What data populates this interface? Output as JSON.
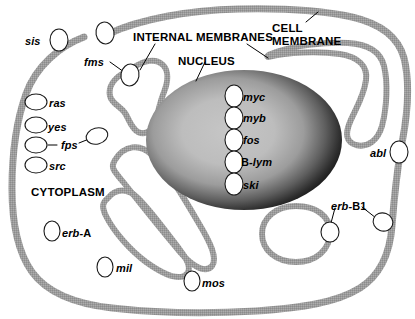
{
  "diagram": {
    "colors": {
      "membrane": "#9a9a9a",
      "membrane_dark": "#8a8a8a",
      "nucleus_rim": "#1c1c1c",
      "nucleus_center": "#c2c2c2",
      "background": "#ffffff",
      "ink": "#000000",
      "protein_fill": "#ffffff",
      "protein_stroke": "#1a1a1a"
    },
    "region_labels": [
      {
        "id": "internal-membranes",
        "text": "INTERNAL MEMBRANES",
        "x": 133,
        "y": 32
      },
      {
        "id": "cell-membrane",
        "text": "CELL\nMEMBRANE",
        "x": 272,
        "y": 22
      },
      {
        "id": "nucleus",
        "text": "NUCLEUS",
        "x": 178,
        "y": 56
      },
      {
        "id": "cytoplasm",
        "text": "CYTOPLASM",
        "x": 31,
        "y": 187
      }
    ],
    "gene_labels": [
      {
        "id": "sis",
        "text": "sis",
        "suffix": "",
        "x": 25,
        "y": 36
      },
      {
        "id": "fms",
        "text": "fms",
        "suffix": "",
        "x": 84,
        "y": 57
      },
      {
        "id": "ras",
        "text": "ras",
        "suffix": "",
        "x": 49,
        "y": 98
      },
      {
        "id": "yes",
        "text": "yes",
        "suffix": "",
        "x": 48,
        "y": 122
      },
      {
        "id": "fps",
        "text": "fps",
        "suffix": "",
        "x": 61,
        "y": 140
      },
      {
        "id": "src",
        "text": "src",
        "suffix": "",
        "x": 49,
        "y": 161
      },
      {
        "id": "erb-A",
        "text": "erb-",
        "suffix": "A",
        "x": 62,
        "y": 228
      },
      {
        "id": "mil",
        "text": "mil",
        "suffix": "",
        "x": 116,
        "y": 263
      },
      {
        "id": "mos",
        "text": "mos",
        "suffix": "",
        "x": 202,
        "y": 278
      },
      {
        "id": "abl",
        "text": "abl",
        "suffix": "",
        "x": 370,
        "y": 148
      },
      {
        "id": "erb-B1",
        "text": "erb-",
        "suffix": "B1",
        "x": 331,
        "y": 201
      }
    ],
    "nucleus_genes": [
      {
        "id": "myc",
        "text": "myc",
        "suffix": "",
        "x": 243,
        "y": 92
      },
      {
        "id": "myb",
        "text": "myb",
        "suffix": "",
        "x": 243,
        "y": 113
      },
      {
        "id": "fos",
        "text": "fos",
        "suffix": "",
        "x": 243,
        "y": 135
      },
      {
        "id": "B-lym",
        "text": "B-",
        "suffix": "",
        "upfirst": "B-",
        "rest": "lym",
        "x": 241,
        "y": 157
      },
      {
        "id": "ski",
        "text": "ski",
        "suffix": "",
        "x": 243,
        "y": 180
      }
    ],
    "proteins": [
      {
        "id": "protein-sis",
        "cx": 59,
        "cy": 40,
        "rx": 9,
        "ry": 11,
        "rot": 0,
        "location": "extracellular"
      },
      {
        "id": "protein-fms-top",
        "cx": 105,
        "cy": 33,
        "rx": 9,
        "ry": 11,
        "rot": -10,
        "location": "cell-membrane"
      },
      {
        "id": "protein-fms",
        "cx": 130,
        "cy": 75,
        "rx": 9,
        "ry": 11,
        "rot": 10,
        "location": "internal-membrane"
      },
      {
        "id": "protein-ras",
        "cx": 36,
        "cy": 102,
        "rx": 11,
        "ry": 8,
        "rot": 0,
        "location": "cell-membrane"
      },
      {
        "id": "protein-yes",
        "cx": 36,
        "cy": 125,
        "rx": 11,
        "ry": 8,
        "rot": 0,
        "location": "cell-membrane"
      },
      {
        "id": "protein-fps",
        "cx": 36,
        "cy": 145,
        "rx": 11,
        "ry": 8,
        "rot": 0,
        "location": "cell-membrane"
      },
      {
        "id": "protein-fps-free",
        "cx": 97,
        "cy": 136,
        "rx": 11,
        "ry": 8,
        "rot": -15,
        "location": "cytoplasm"
      },
      {
        "id": "protein-src",
        "cx": 36,
        "cy": 165,
        "rx": 11,
        "ry": 8,
        "rot": 0,
        "location": "cell-membrane"
      },
      {
        "id": "protein-erb-A",
        "cx": 52,
        "cy": 231,
        "rx": 8,
        "ry": 10,
        "rot": 0,
        "location": "cytoplasm"
      },
      {
        "id": "protein-mil",
        "cx": 105,
        "cy": 267,
        "rx": 8,
        "ry": 10,
        "rot": 0,
        "location": "cytoplasm"
      },
      {
        "id": "protein-mos",
        "cx": 192,
        "cy": 281,
        "rx": 8,
        "ry": 10,
        "rot": 0,
        "location": "cytoplasm"
      },
      {
        "id": "protein-abl",
        "cx": 399,
        "cy": 152,
        "rx": 9,
        "ry": 11,
        "rot": 0,
        "location": "cell-membrane"
      },
      {
        "id": "protein-erb-B1-membrane",
        "cx": 383,
        "cy": 222,
        "rx": 10,
        "ry": 9,
        "rot": 20,
        "location": "cell-membrane"
      },
      {
        "id": "protein-erb-B1-vesicle",
        "cx": 330,
        "cy": 232,
        "rx": 9,
        "ry": 10,
        "rot": 0,
        "location": "internal-membrane"
      },
      {
        "id": "protein-myc",
        "cx": 234,
        "cy": 96,
        "rx": 9,
        "ry": 11,
        "rot": 0,
        "location": "nucleus"
      },
      {
        "id": "protein-myb",
        "cx": 234,
        "cy": 118,
        "rx": 9,
        "ry": 11,
        "rot": 0,
        "location": "nucleus"
      },
      {
        "id": "protein-fos",
        "cx": 234,
        "cy": 140,
        "rx": 9,
        "ry": 11,
        "rot": 0,
        "location": "nucleus"
      },
      {
        "id": "protein-B-lym",
        "cx": 234,
        "cy": 162,
        "rx": 9,
        "ry": 11,
        "rot": 0,
        "location": "nucleus"
      },
      {
        "id": "protein-ski",
        "cx": 234,
        "cy": 184,
        "rx": 9,
        "ry": 11,
        "rot": 0,
        "location": "nucleus"
      }
    ],
    "leader_lines": [
      {
        "id": "leader-internal-membranes-left",
        "x1": 155,
        "y1": 44,
        "x2": 140,
        "y2": 70
      },
      {
        "id": "leader-internal-membranes-right",
        "x1": 247,
        "y1": 44,
        "x2": 268,
        "y2": 58
      },
      {
        "id": "leader-cell-membrane",
        "x1": 306,
        "y1": 22,
        "x2": 318,
        "y2": 12
      },
      {
        "id": "leader-nucleus",
        "x1": 205,
        "y1": 62,
        "x2": 196,
        "y2": 81
      },
      {
        "id": "leader-fms",
        "x1": 110,
        "y1": 62,
        "x2": 124,
        "y2": 72
      },
      {
        "id": "leader-fps-left",
        "x1": 48,
        "y1": 145,
        "x2": 57,
        "y2": 145
      },
      {
        "id": "leader-fps-right",
        "x1": 79,
        "y1": 143,
        "x2": 89,
        "y2": 139
      },
      {
        "id": "leader-erb-B1-vesicle",
        "x1": 335,
        "y1": 208,
        "x2": 331,
        "y2": 223
      },
      {
        "id": "leader-erb-B1-membrane",
        "x1": 362,
        "y1": 207,
        "x2": 376,
        "y2": 218
      }
    ]
  }
}
